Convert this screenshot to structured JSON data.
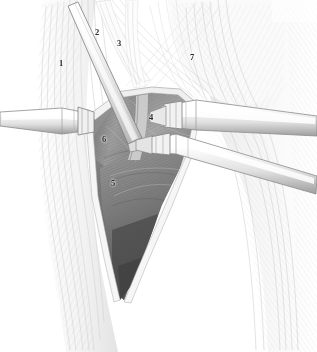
{
  "figure": {
    "kind": "anatomical-surgical-illustration",
    "title": "",
    "caption": "",
    "width": 317,
    "height": 352,
    "background_color": "#ffffff",
    "style": "grayscale pen-and-ink hatched medical illustration"
  },
  "palette": {
    "paper": "#ffffff",
    "faint_line": "#e2e2e2",
    "light_line": "#cfcfcf",
    "mid_line": "#a8a8a8",
    "dark_line": "#6e6e6e",
    "ink": "#3a3a3a",
    "label_ink": "#2b2b2b",
    "wound_light": "#b9b9b9",
    "wound_mid": "#8f8f8f",
    "wound_dark": "#5e5e5e",
    "wound_deep": "#4a4a4a",
    "instrument_fill": "#fbfbfb",
    "instrument_shade": "#d6d6d6",
    "instrument_edge": "#8a8a8a"
  },
  "callouts": [
    {
      "id": "callout-1",
      "label": "1",
      "x": 61,
      "y": 63
    },
    {
      "id": "callout-2",
      "label": "2",
      "x": 97,
      "y": 32
    },
    {
      "id": "callout-3",
      "label": "3",
      "x": 119,
      "y": 43
    },
    {
      "id": "callout-4",
      "label": "4",
      "x": 151,
      "y": 117
    },
    {
      "id": "callout-5",
      "label": "5",
      "x": 113,
      "y": 183
    },
    {
      "id": "callout-6",
      "label": "6",
      "x": 104,
      "y": 139
    },
    {
      "id": "callout-7",
      "label": "7",
      "x": 192,
      "y": 57
    }
  ],
  "regions": {
    "wound_cavity": "central dark V-shaped surgical exposure",
    "left_limb_margin": "hatched skin and fascia band on left",
    "right_limb_margin": "hatched skin and fascia band on right",
    "upper_condyle": "rounded bony prominence upper right"
  },
  "instruments": [
    {
      "id": "retractor-diagonal-upper-left",
      "name": "long-diagonal-retractor-blade"
    },
    {
      "id": "retractor-left-horizontal",
      "name": "left-horizontal-retractor"
    },
    {
      "id": "retractor-right-horizontal",
      "name": "right-horizontal-retractor"
    },
    {
      "id": "retractor-right-oblique",
      "name": "right-oblique-retractor"
    }
  ]
}
